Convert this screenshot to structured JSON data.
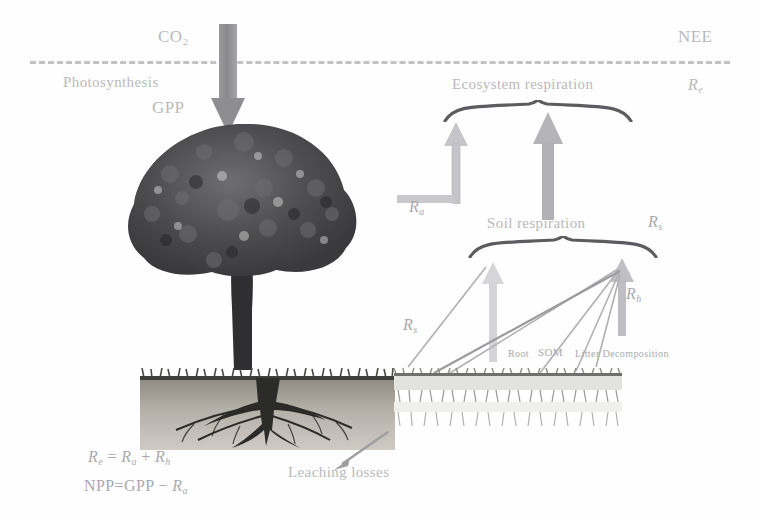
{
  "figure": {
    "background_color": "#fefefe",
    "ink_color": "#b9b9bc"
  },
  "atmosphere": {
    "boundary_style": "dashed",
    "co2_label": "CO₂",
    "nee_label": "NEE",
    "nee_symbol": "R",
    "nee_symbol_sub": "e"
  },
  "fluxes": {
    "photosynthesis_label": "Photosynthesis",
    "gpp_label": "GPP",
    "gpp_arrow_direction": "down",
    "ecosystem_respiration_label": "Ecosystem respiration",
    "ecosystem_respiration_symbol": "R",
    "ecosystem_respiration_sub": "e",
    "soil_respiration_label": "Soil respiration",
    "soil_respiration_symbol": "R",
    "soil_respiration_sub": "s",
    "autotrophic_symbol": "R",
    "autotrophic_sub": "a",
    "soil_symbol": "R",
    "soil_sub": "s",
    "heterotrophic_symbol": "R",
    "heterotrophic_sub": "h"
  },
  "soil": {
    "root_label": "Root",
    "som_label": "SOM",
    "litter_label": "Litter Decomposition",
    "leaching_label": "Leaching losses"
  },
  "equations": {
    "eq1": {
      "lhs": "R",
      "lhs_sub": "e",
      "op1": "=",
      "term1": "R",
      "term1_sub": "a",
      "op2": "+",
      "term2": "R",
      "term2_sub": "h"
    },
    "eq2": {
      "lhs": "NPP",
      "op1": "=",
      "term1": "GPP",
      "op2": "−",
      "term2": "R",
      "term2_sub": "a"
    }
  },
  "icons": {
    "tree": "tree-icon",
    "soil": "soil-profile-icon",
    "down_arrow": "down-arrow-icon",
    "up_arrow": "up-arrow-icon",
    "brace": "curly-brace-icon"
  }
}
